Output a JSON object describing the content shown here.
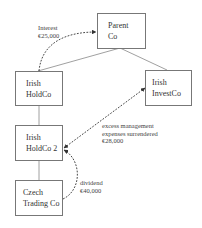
{
  "diagram": {
    "type": "corporate structure / intercompany flows",
    "entities": [
      {
        "id": "parent_co",
        "line1": "Parent",
        "line2": "Co"
      },
      {
        "id": "irish_holdco",
        "line1": "Irish",
        "line2": "HoldCo"
      },
      {
        "id": "irish_investco",
        "line1": "Irish",
        "line2": "InvestCo"
      },
      {
        "id": "irish_holdco_2",
        "line1": "Irish",
        "line2": "HoldCo 2"
      },
      {
        "id": "czech_trading_co",
        "line1": "Czech",
        "line2": "Trading Co"
      }
    ],
    "ownership_links": [
      {
        "from": "parent_co",
        "to": "irish_holdco"
      },
      {
        "from": "parent_co",
        "to": "irish_investco"
      },
      {
        "from": "irish_holdco",
        "to": "irish_holdco_2"
      },
      {
        "from": "irish_holdco_2",
        "to": "czech_trading_co"
      }
    ],
    "flows": [
      {
        "id": "interest",
        "from": "irish_holdco",
        "to": "parent_co",
        "line1": "Interest",
        "line2": "€25,000"
      },
      {
        "id": "mgmt_expenses",
        "from": "irish_investco",
        "to": "irish_holdco_2",
        "bidirectional": true,
        "line1": "excess management",
        "line2": "expenses surrendered",
        "line3": "€28,000"
      },
      {
        "id": "dividend",
        "from": "czech_trading_co",
        "to": "irish_holdco_2",
        "line1": "dividend",
        "line2": "€40,000"
      }
    ],
    "colors": {
      "box_border": "#777777",
      "line": "#777777",
      "dashed_arrow": "#333333"
    }
  }
}
